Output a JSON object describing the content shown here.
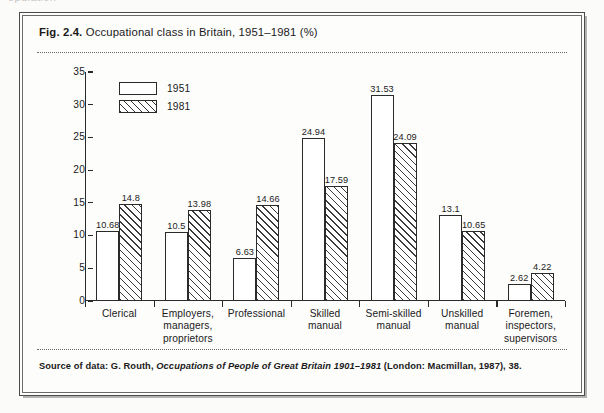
{
  "page": {
    "cutoff_text_above_box": "opulation"
  },
  "figure": {
    "fig_number": "Fig. 2.4.",
    "caption": "Occupational class in Britain, 1951–1981 (%)",
    "source_prefix": "Source of data: G. Routh, ",
    "source_italic": "Occupations of People of Great Britain 1901–1981",
    "source_suffix": " (London: Macmillan, 1987), 38."
  },
  "chart_data": {
    "type": "bar",
    "title": "Occupational class in Britain, 1951–1981 (%)",
    "xlabel": "",
    "ylabel": "",
    "ylim": [
      0,
      35
    ],
    "yticks": [
      "0",
      "5",
      "10",
      "15",
      "20",
      "25",
      "30",
      "35"
    ],
    "grid": false,
    "legend_position": "top-left",
    "categories": [
      "Clerical",
      "Employers, managers, proprietors",
      "Professional",
      "Skilled manual",
      "Semi-skilled manual",
      "Unskilled manual",
      "Foremen, inspectors, supervisors"
    ],
    "category_lines": [
      [
        "Clerical"
      ],
      [
        "Employers,",
        "managers,",
        "proprietors"
      ],
      [
        "Professional"
      ],
      [
        "Skilled",
        "manual"
      ],
      [
        "Semi-skilled",
        "manual"
      ],
      [
        "Unskilled",
        "manual"
      ],
      [
        "Foremen,",
        "inspectors,",
        "supervisors"
      ]
    ],
    "series": [
      {
        "name": "1951",
        "fill": "white",
        "values": [
          10.68,
          10.5,
          6.63,
          24.94,
          31.53,
          13.1,
          2.62
        ],
        "labels": [
          "10.68",
          "10.5",
          "6.63",
          "24.94",
          "31.53",
          "13.1",
          "2.62"
        ]
      },
      {
        "name": "1981",
        "fill": "hatched",
        "values": [
          14.8,
          13.98,
          14.66,
          17.59,
          24.09,
          10.65,
          4.22
        ],
        "labels": [
          "14.8",
          "13.98",
          "14.66",
          "17.59",
          "24.09",
          "10.65",
          "4.22"
        ]
      }
    ]
  },
  "colors": {
    "ink": "#1a1a1a",
    "axis": "#2a2a2a",
    "border": "#4a4a4a",
    "paper": "#fdfdfc"
  }
}
